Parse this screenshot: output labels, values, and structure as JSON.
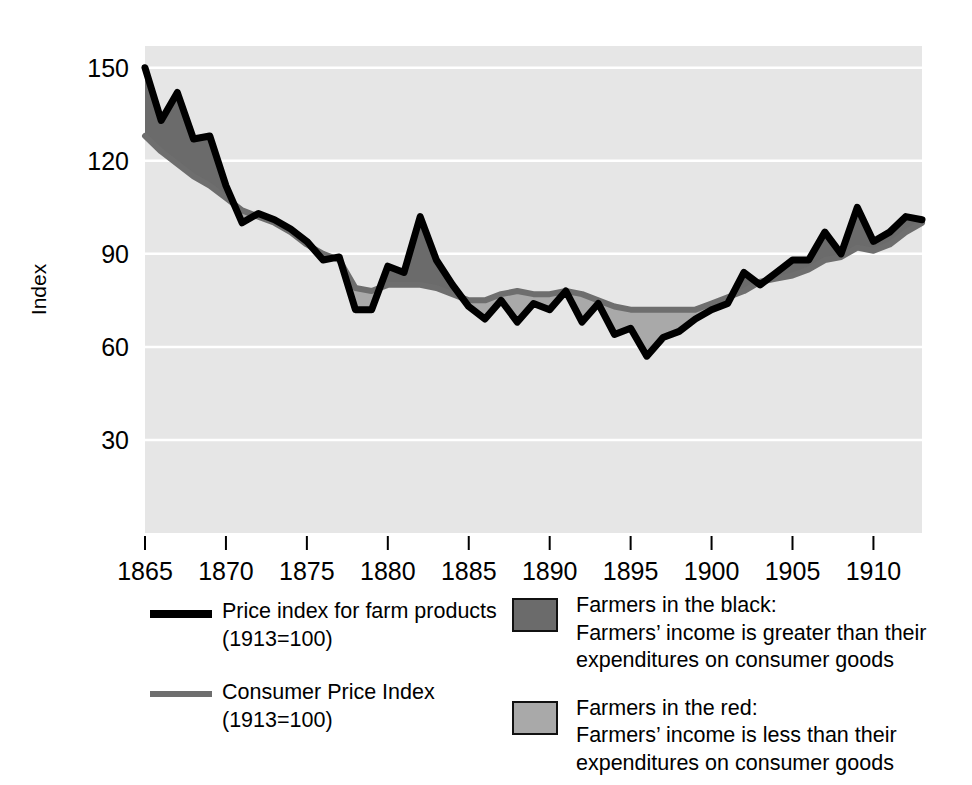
{
  "chart_data": {
    "type": "area",
    "title": "",
    "subtitle": "",
    "xlabel": "",
    "ylabel": "Index",
    "xlim": [
      1865,
      1913
    ],
    "ylim": [
      0,
      157
    ],
    "grid": true,
    "gridlines_y": [
      30,
      60,
      90,
      120,
      150
    ],
    "xticks": [
      1865,
      1870,
      1875,
      1880,
      1885,
      1890,
      1895,
      1900,
      1905,
      1910
    ],
    "yticks": [
      30,
      60,
      90,
      120,
      150
    ],
    "xtick_labels": [
      "1865",
      "1870",
      "1875",
      "1880",
      "1885",
      "1890",
      "1895",
      "1900",
      "1905",
      "1910"
    ],
    "ytick_labels": [
      "30",
      "60",
      "90",
      "120",
      "150"
    ],
    "legend_position": "below",
    "x": [
      1865,
      1866,
      1867,
      1868,
      1869,
      1870,
      1871,
      1872,
      1873,
      1874,
      1875,
      1876,
      1877,
      1878,
      1879,
      1880,
      1881,
      1882,
      1883,
      1884,
      1885,
      1886,
      1887,
      1888,
      1889,
      1890,
      1891,
      1892,
      1893,
      1894,
      1895,
      1896,
      1897,
      1898,
      1899,
      1900,
      1901,
      1902,
      1903,
      1904,
      1905,
      1906,
      1907,
      1908,
      1909,
      1910,
      1911,
      1912,
      1913
    ],
    "series": [
      {
        "name": "Price index for farm products (1913=100)",
        "color": "#000000",
        "values": [
          150,
          133,
          142,
          127,
          128,
          112,
          100,
          103,
          101,
          98,
          94,
          88,
          89,
          72,
          72,
          86,
          84,
          102,
          88,
          80,
          73,
          69,
          75,
          68,
          74,
          72,
          78,
          68,
          74,
          64,
          66,
          57,
          63,
          65,
          69,
          72,
          74,
          84,
          80,
          84,
          88,
          88,
          97,
          90,
          105,
          94,
          97,
          102,
          101
        ]
      },
      {
        "name": "Consumer Price Index (1913=100)",
        "color": "#6e6e6e",
        "values": [
          128,
          123,
          119,
          115,
          112,
          108,
          104,
          102,
          100,
          97,
          93,
          90,
          88,
          79,
          78,
          80,
          80,
          80,
          79,
          77,
          75,
          75,
          77,
          78,
          77,
          77,
          78,
          77,
          75,
          73,
          72,
          72,
          72,
          72,
          72,
          74,
          76,
          78,
          81,
          82,
          83,
          85,
          88,
          89,
          92,
          91,
          93,
          97,
          100
        ]
      }
    ],
    "fills": [
      {
        "name": "Farmers in the black",
        "color": "#6b6b6b",
        "meaning": "Farmers' income is greater than their expenditures on consumer goods"
      },
      {
        "name": "Farmers in the red",
        "color": "#a9a9a9",
        "meaning": "Farmers' income is less than their expenditures on consumer goods"
      }
    ],
    "plot_background": "#e6e6e6",
    "gridline_color": "#ffffff"
  },
  "axis": {
    "y_title": "Index"
  },
  "legend": {
    "items": [
      {
        "id": "farm-products",
        "marker": "line-black",
        "text": "Price index for farm products\n(1913=100)"
      },
      {
        "id": "consumer-price-index",
        "marker": "line-gray",
        "text": "Consumer Price Index\n(1913=100)"
      },
      {
        "id": "farmers-in-the-black",
        "marker": "box-dark",
        "text": "Farmers in the black:\nFarmers’ income is greater than their\nexpenditures on consumer goods"
      },
      {
        "id": "farmers-in-the-red",
        "marker": "box-light",
        "text": "Farmers in the red:\nFarmers’ income is less than their\nexpenditures on consumer goods"
      }
    ]
  }
}
